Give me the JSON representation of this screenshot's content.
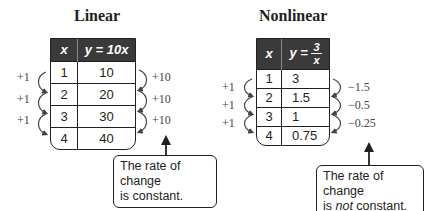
{
  "linear": {
    "title": "Linear",
    "headers": {
      "x": "x",
      "y": "y = 10x"
    },
    "rows": [
      {
        "x": "1",
        "y": "10"
      },
      {
        "x": "2",
        "y": "20"
      },
      {
        "x": "3",
        "y": "30"
      },
      {
        "x": "4",
        "y": "40"
      }
    ],
    "x_changes": [
      "+1",
      "+1",
      "+1"
    ],
    "y_changes": [
      "+10",
      "+10",
      "+10"
    ],
    "callout": {
      "line1": "The rate of change",
      "line2": "is constant."
    }
  },
  "nonlinear": {
    "title": "Nonlinear",
    "headers": {
      "x": "x",
      "y_prefix": "y =",
      "y_num": "3",
      "y_den": "x"
    },
    "rows": [
      {
        "x": "1",
        "y": "3"
      },
      {
        "x": "2",
        "y": "1.5"
      },
      {
        "x": "3",
        "y": "1"
      },
      {
        "x": "4",
        "y": "0.75"
      }
    ],
    "x_changes": [
      "+1",
      "+1",
      "+1"
    ],
    "y_changes": [
      "−1.5",
      "−0.5",
      "−0.25"
    ],
    "callout": {
      "line1": "The rate of change",
      "line2_pre": "is ",
      "line2_em": "not",
      "line2_post": " constant."
    }
  },
  "colors": {
    "header_bg": "#3a3a3a",
    "text": "#231f20",
    "label": "#444444"
  }
}
